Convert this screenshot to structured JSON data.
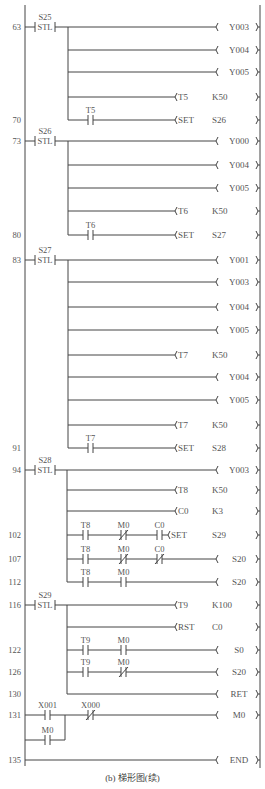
{
  "diagram": {
    "caption": "(b) 梯形图(续)",
    "colors": {
      "line": "#444444",
      "text": "#555555"
    },
    "rails": {
      "left_x": 25,
      "right_x": 260,
      "top_y": 5,
      "bottom_y": 766
    },
    "steps": [
      {
        "step": "63",
        "y": 27,
        "stl": "S25",
        "branch_x": 68,
        "rows": [
          {
            "y": 27,
            "coil": "( Y003 )"
          },
          {
            "y": 50,
            "coil": "( Y004 )"
          },
          {
            "y": 72,
            "coil": "( Y005 )"
          },
          {
            "y": 97,
            "timer": "T5",
            "param": "K50"
          },
          {
            "y": 120,
            "step": "70",
            "contacts": [
              {
                "label": "T5",
                "type": "NO",
                "x": 88
              }
            ],
            "set": "SET",
            "target": "S26"
          }
        ]
      },
      {
        "step": "73",
        "y": 141,
        "stl": "S26",
        "branch_x": 68,
        "rows": [
          {
            "y": 141,
            "coil": "( Y000 )"
          },
          {
            "y": 165,
            "coil": "( Y004 )"
          },
          {
            "y": 188,
            "coil": "( Y005 )"
          },
          {
            "y": 211,
            "timer": "T6",
            "param": "K50"
          },
          {
            "y": 235,
            "step": "80",
            "contacts": [
              {
                "label": "T6",
                "type": "NO",
                "x": 88
              }
            ],
            "set": "SET",
            "target": "S27"
          }
        ]
      },
      {
        "step": "83",
        "y": 260,
        "stl": "S27",
        "branch_x": 68,
        "rows": [
          {
            "y": 260,
            "coil": "( Y001 )"
          },
          {
            "y": 282,
            "coil": "( Y003 )"
          },
          {
            "y": 307,
            "coil": "( Y004 )"
          },
          {
            "y": 330,
            "coil": "( Y005 )"
          },
          {
            "y": 355,
            "timer": "T7",
            "param": "K50"
          },
          {
            "y": 377,
            "coil": "( Y004 )"
          },
          {
            "y": 400,
            "coil": "( Y005 )"
          },
          {
            "y": 425,
            "timer": "T7",
            "param": "K50"
          },
          {
            "y": 448,
            "step": "91",
            "contacts": [
              {
                "label": "T7",
                "type": "NO",
                "x": 88
              }
            ],
            "set": "SET",
            "target": "S28"
          }
        ]
      },
      {
        "step": "94",
        "y": 470,
        "stl": "S28",
        "branch_x": 67,
        "rows": [
          {
            "y": 470,
            "coil": "( Y003 )"
          },
          {
            "y": 490,
            "timer": "T8",
            "param": "K50"
          },
          {
            "y": 511,
            "timer": "C0",
            "param": "K3"
          },
          {
            "y": 535,
            "step": "102",
            "contacts": [
              {
                "label": "T8",
                "type": "NO",
                "x": 83
              },
              {
                "label": "M0",
                "type": "NC",
                "x": 121
              },
              {
                "label": "C0",
                "type": "NO",
                "x": 157
              }
            ],
            "set": "SET",
            "target": "S29",
            "set_x": 168
          },
          {
            "y": 559,
            "step": "107",
            "contacts": [
              {
                "label": "T8",
                "type": "NO",
                "x": 83
              },
              {
                "label": "M0",
                "type": "NC",
                "x": 121
              },
              {
                "label": "C0",
                "type": "NC",
                "x": 157
              }
            ],
            "coil": "( S20 )"
          },
          {
            "y": 582,
            "step": "112",
            "contacts": [
              {
                "label": "T8",
                "type": "NO",
                "x": 83
              },
              {
                "label": "M0",
                "type": "NO",
                "x": 121
              }
            ],
            "coil": "( S20 )"
          }
        ]
      },
      {
        "step": "116",
        "y": 605,
        "stl": "S29",
        "branch_x": 67,
        "rows": [
          {
            "y": 605,
            "timer": "T9",
            "param": "K100"
          },
          {
            "y": 627,
            "set": "RST",
            "target": "C0"
          },
          {
            "y": 650,
            "step": "122",
            "contacts": [
              {
                "label": "T9",
                "type": "NO",
                "x": 83
              },
              {
                "label": "M0",
                "type": "NO",
                "x": 121
              }
            ],
            "coil": "( S0 )"
          },
          {
            "y": 672,
            "step": "126",
            "contacts": [
              {
                "label": "T9",
                "type": "NO",
                "x": 83
              },
              {
                "label": "M0",
                "type": "NC",
                "x": 121
              }
            ],
            "coil": "( S20 )"
          },
          {
            "y": 694,
            "step": "130",
            "coil": "[ RET ]"
          }
        ]
      }
    ],
    "rung131": {
      "step": "131",
      "y": 715,
      "y2": 740,
      "contact_top": {
        "label": "X001",
        "type": "NO",
        "x": 45
      },
      "contact_bottom": {
        "label": "M0",
        "type": "NO",
        "x": 45
      },
      "join_x": 65,
      "contact_series": {
        "label": "X000",
        "type": "NC",
        "x": 88
      },
      "coil": "( M0 )"
    },
    "rung135": {
      "step": "135",
      "y": 760,
      "coil": "[ END ]"
    }
  }
}
